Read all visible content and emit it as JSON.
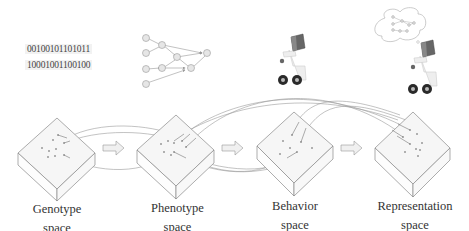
{
  "genotype_bits": [
    "00100101101011",
    "10001001100100"
  ],
  "spaces": [
    {
      "id": "genotype",
      "line1": "Genotype",
      "line2": "space"
    },
    {
      "id": "phenotype",
      "line1": "Phenotype",
      "line2": "space"
    },
    {
      "id": "behavior",
      "line1": "Behavior",
      "line2": "space"
    },
    {
      "id": "representation",
      "line1": "Representation",
      "line2": "space"
    }
  ],
  "icons": {
    "phenotype": "neural-network-graph",
    "behavior": "wheeled-robot",
    "representation": "robot-with-thought-bubble-network"
  },
  "colors": {
    "stroke": "#8a8a8a",
    "text": "#333333",
    "node_fill": "#e0e0e0",
    "robot_head": "#555555",
    "wheel": "#2a2a2a"
  }
}
